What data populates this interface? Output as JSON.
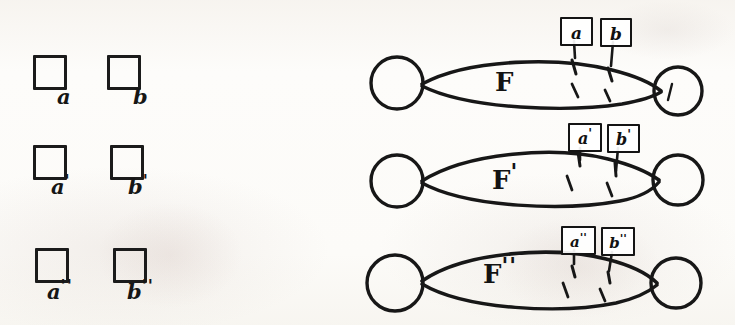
{
  "figure": {
    "background_color": "#fdfcfa",
    "ink_color": "#161616"
  },
  "left_panel": {
    "name": "square-grid",
    "rows": [
      {
        "row_id": "row-1",
        "cells": [
          {
            "shape": "square",
            "label": "a",
            "prime": ""
          },
          {
            "shape": "square",
            "label": "b",
            "prime": ""
          }
        ]
      },
      {
        "row_id": "row-2",
        "cells": [
          {
            "shape": "square",
            "label": "a",
            "prime": "'"
          },
          {
            "shape": "square",
            "label": "b",
            "prime": "'"
          }
        ]
      },
      {
        "row_id": "row-3",
        "cells": [
          {
            "shape": "square",
            "label": "a",
            "prime": "''"
          },
          {
            "shape": "square",
            "label": "b",
            "prime": "''"
          }
        ]
      }
    ]
  },
  "right_panel": {
    "name": "bigon-diagrams",
    "diagrams": [
      {
        "diagram_id": "bigon-F",
        "surface_label": "F",
        "surface_prime": "",
        "left_node": "circle",
        "right_node": "circle",
        "arc_tags": [
          {
            "text": "a",
            "prime": ""
          },
          {
            "text": "b",
            "prime": ""
          }
        ],
        "dashed_arc_count": 2
      },
      {
        "diagram_id": "bigon-F-prime",
        "surface_label": "F",
        "surface_prime": "'",
        "left_node": "circle",
        "right_node": "circle",
        "arc_tags": [
          {
            "text": "a",
            "prime": "'"
          },
          {
            "text": "b",
            "prime": "'"
          }
        ],
        "dashed_arc_count": 2
      },
      {
        "diagram_id": "bigon-F-double-prime",
        "surface_label": "F",
        "surface_prime": "''",
        "left_node": "circle",
        "right_node": "circle",
        "arc_tags": [
          {
            "text": "a",
            "prime": "''"
          },
          {
            "text": "b",
            "prime": "''"
          }
        ],
        "dashed_arc_count": 2
      }
    ]
  },
  "background_ghost_text": {
    "line_1": "",
    "line_2": "",
    "line_3": ""
  }
}
